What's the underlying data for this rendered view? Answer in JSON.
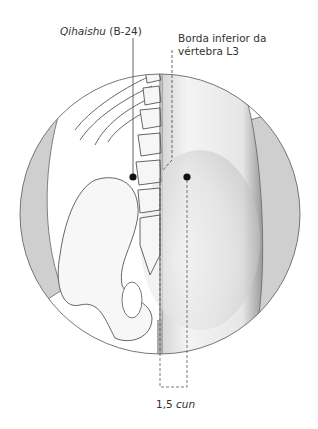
{
  "labels": {
    "point_name": "Qihaishu",
    "point_code": "(B-24)",
    "landmark_line1": "Borda inferior da",
    "landmark_line2": "vértebra L3",
    "measure_value": "1,5",
    "measure_unit": "cun"
  },
  "colors": {
    "line": "#555555",
    "shade": "#c8c8c8",
    "dot": "#111111"
  }
}
